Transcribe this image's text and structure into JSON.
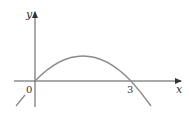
{
  "diagram": {
    "type": "function-graph",
    "axes": {
      "x_label": "x",
      "y_label": "y",
      "origin_label": "0"
    },
    "ticks": [
      {
        "value": "3",
        "label": "3"
      }
    ],
    "curve": {
      "description": "downward-opening parabola through (0,0) and (3,0)",
      "x_intercepts": [
        0,
        3
      ],
      "color": "#8a8a8a"
    },
    "colors": {
      "axis": "#555555",
      "curve": "#8a8a8a",
      "text": "#333333"
    }
  }
}
